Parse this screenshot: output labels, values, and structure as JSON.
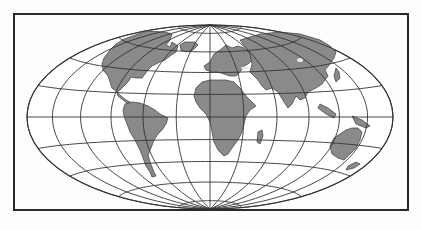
{
  "map": {
    "projection": "elliptical world map (Hammer/Aitoff-like)",
    "colors": {
      "background": "#fdfdfd",
      "frame": "#2a2a2a",
      "ocean": "#ffffff",
      "land": "#8a8a8a",
      "graticule": "#333333"
    },
    "frame": {
      "x": 14,
      "y": 14,
      "width": 394,
      "height": 196
    },
    "ellipse": {
      "cx": 210,
      "cy": 117,
      "rx": 183,
      "ry": 92
    },
    "graticule": {
      "meridian_count": 13,
      "parallel_count": 9
    },
    "continents": [
      "North America",
      "South America",
      "Greenland",
      "Europe",
      "Asia",
      "Africa",
      "Madagascar",
      "Australia",
      "New Zealand",
      "Japan",
      "Indonesia",
      "Antarctica (not shown)"
    ]
  }
}
